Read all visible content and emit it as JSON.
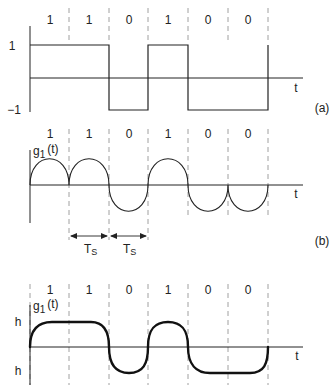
{
  "bits": [
    "1",
    "1",
    "0",
    "1",
    "0",
    "0"
  ],
  "panel_a": {
    "label": "(a)",
    "y_labels": {
      "pos": "1",
      "neg": "−1"
    },
    "axis_label": "t"
  },
  "panel_b": {
    "label": "(b)",
    "signal_label": "g",
    "signal_sub": "1",
    "signal_arg": "(t)",
    "axis_label": "t",
    "ts_label": "T",
    "ts_sub": "S"
  },
  "panel_c": {
    "signal_label": "g",
    "signal_sub": "1",
    "signal_arg": "(t)",
    "y_labels": {
      "pos": "h",
      "neg": "h"
    },
    "axis_label": "t"
  }
}
